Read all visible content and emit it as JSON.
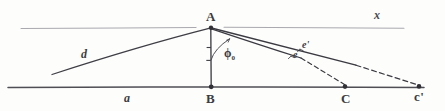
{
  "figure": {
    "kind": "hand-drawn-geometry-sketch",
    "width": 445,
    "height": 111,
    "background_color": "#fdfdfc",
    "ink_color": "#3b3b3f",
    "faint_ink_color": "#8a8a90"
  },
  "points": {
    "apex": {
      "label": "A",
      "x": 211,
      "y": 27
    },
    "base_foot": {
      "label": "B",
      "x": 211,
      "y": 87
    },
    "target_near": {
      "label": "C",
      "x": 345,
      "y": 87
    },
    "target_far": {
      "label": "c'",
      "x": 419,
      "y": 87
    }
  },
  "segments": {
    "horizon": {
      "label": "x",
      "description": "upper horizontal reference line through A"
    },
    "baseline": {
      "label": "a",
      "description": "lower horizontal ground line through B, C, c'"
    },
    "left_ray": {
      "label": "d",
      "description": "slanted ray down-left from A"
    },
    "ray_upper": {
      "label": "e'",
      "description": "ray from A toward c'"
    },
    "ray_lower": {
      "label": "e",
      "description": "ray from A toward C"
    },
    "vertical": {
      "label": "",
      "description": "vertical drop from A to B"
    }
  },
  "angle": {
    "symbol": "ϕ",
    "subscript": "0",
    "description": "angle between vertical AB and ray e'"
  },
  "labels": {
    "A": "A",
    "B": "B",
    "C": "C",
    "c_prime": "c'",
    "x": "x",
    "a": "a",
    "d": "d",
    "e": "e",
    "e_prime": "e'",
    "phi": "ϕ",
    "phi_sub": "0"
  }
}
